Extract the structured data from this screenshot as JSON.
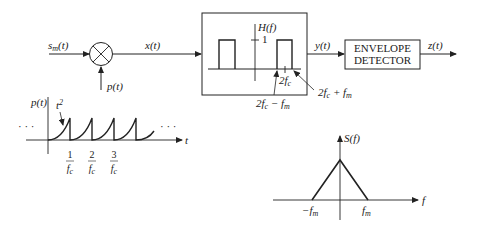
{
  "diagram": {
    "type": "block-diagram",
    "blocks": {
      "input_signal": "s_m(t)",
      "mixer": {
        "symbol": "⊗",
        "side_input": "p(t)"
      },
      "mixer_output": "x(t)",
      "bandpass_filter": {
        "label": "H(f)",
        "gain": "1",
        "center_label": "2f_c",
        "lower_edge_label": "2f_c − f_m",
        "upper_edge_label": "2f_c + f_m"
      },
      "filter_output": "y(t)",
      "envelope_detector": {
        "line1": "ENVELOPE",
        "line2": "DETECTOR"
      },
      "output_signal": "z(t)"
    },
    "pulse_plot": {
      "ylabel": "p(t)",
      "xlabel": "t",
      "curve_label": "t²",
      "ellipsis_left": "· · ·",
      "ellipsis_right": "· · · ·",
      "ticks": [
        {
          "num": "1",
          "den": "f_c"
        },
        {
          "num": "2",
          "den": "f_c"
        },
        {
          "num": "3",
          "den": "f_c"
        }
      ]
    },
    "spectrum_plot": {
      "ylabel": "S(f)",
      "xlabel": "f",
      "ticks": [
        "−f_m",
        "f_m"
      ]
    }
  }
}
